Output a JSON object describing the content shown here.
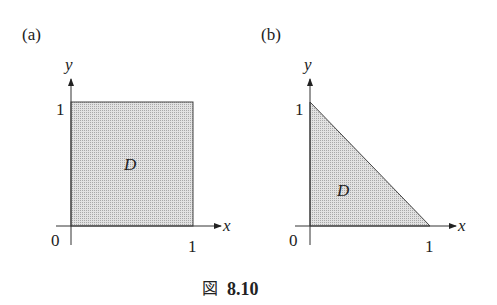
{
  "figure": {
    "caption_prefix": "図",
    "caption_number": "8.10",
    "fill_color": "#d4d4d4",
    "stroke_color": "#333333"
  },
  "panels": [
    {
      "label": "(a)",
      "region_label": "D",
      "shape": "square",
      "x_axis_label": "x",
      "y_axis_label": "y",
      "origin_label": "0",
      "x_tick_label": "1",
      "y_tick_label": "1"
    },
    {
      "label": "(b)",
      "region_label": "D",
      "shape": "triangle",
      "x_axis_label": "x",
      "y_axis_label": "y",
      "origin_label": "0",
      "x_tick_label": "1",
      "y_tick_label": "1"
    }
  ]
}
